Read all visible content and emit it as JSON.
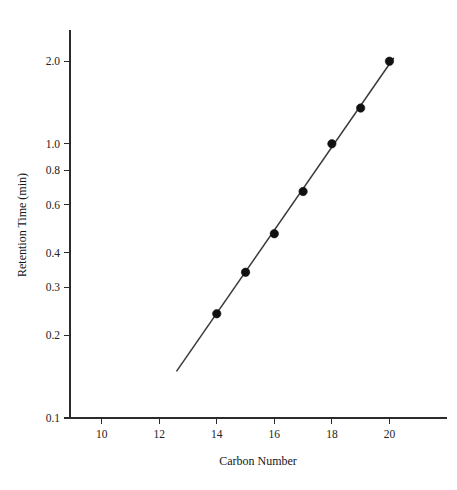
{
  "chart_data": {
    "type": "scatter",
    "title": "",
    "xlabel": "Carbon Number",
    "ylabel": "Retention Time (min)",
    "yscale": "log",
    "xscale": "linear",
    "xlim": [
      8.9,
      22.0
    ],
    "ylim": [
      0.1,
      2.6
    ],
    "grid": false,
    "legend": null,
    "x_ticks": [
      10,
      12,
      14,
      16,
      18,
      20
    ],
    "x_tick_labels": [
      "10",
      "12",
      "14",
      "16",
      "18",
      "20"
    ],
    "y_ticks": [
      0.1,
      0.2,
      0.3,
      0.4,
      0.6,
      0.8,
      1.0,
      2.0
    ],
    "y_tick_labels": [
      "0.1",
      "0.2",
      "0.3",
      "0.4",
      "0.6",
      "0.8",
      "1.0",
      "2.0"
    ],
    "series": [
      {
        "name": "Retention Time",
        "marker": "filled-circle",
        "x": [
          14,
          15,
          16,
          17,
          18,
          19,
          20
        ],
        "values": [
          0.24,
          0.34,
          0.47,
          0.67,
          1.0,
          1.35,
          2.0
        ]
      }
    ],
    "fit_line": {
      "name": "linear fit (semi-log)",
      "x_start": 12.6,
      "y_start": 0.148,
      "x_end": 20.15,
      "y_end": 2.06
    }
  },
  "axes": {
    "x_title": "Carbon Number",
    "y_title": "Retention Time (min)"
  },
  "colors": {
    "axis": "#2b2b2b",
    "marker": "#111111",
    "line": "#3a3a3a",
    "background": "#ffffff",
    "text": "#222222"
  }
}
